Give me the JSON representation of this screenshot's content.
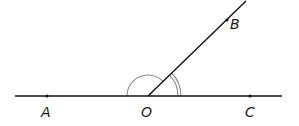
{
  "diagram": {
    "type": "angle-diagram",
    "colors": {
      "line": "#111111",
      "arc": "#8a8a8a",
      "label": "#1a1a1a"
    },
    "points": {
      "A": {
        "label": "A",
        "x": 47,
        "y": 96
      },
      "O": {
        "label": "O",
        "x": 148,
        "y": 96
      },
      "C": {
        "label": "C",
        "x": 250,
        "y": 96
      },
      "B": {
        "label": "B",
        "x": 227,
        "y": 20
      }
    },
    "lines": [
      {
        "name": "line-AC",
        "from": [
          15,
          96
        ],
        "to": [
          282,
          96
        ]
      },
      {
        "name": "ray-OB",
        "from": [
          148,
          96
        ],
        "to": [
          246,
          1
        ]
      }
    ],
    "angle_marks": [
      {
        "name": "angle-AOB",
        "arcs": 1,
        "radius": 21,
        "between": [
          "OA",
          "OB"
        ]
      },
      {
        "name": "angle-BOC",
        "arcs": 2,
        "radii": [
          30,
          33
        ],
        "between": [
          "OB",
          "OC"
        ]
      }
    ]
  }
}
